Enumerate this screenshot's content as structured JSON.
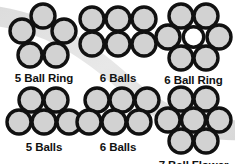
{
  "figure": {
    "background_color": "#ffffff",
    "swoosh_color": "#e4e4e4",
    "ball_fill": "#d2d2d2",
    "ball_stroke": "#111111",
    "hollow_fill": "#ffffff",
    "label_color": "#111111"
  },
  "diagrams": [
    {
      "id": "5-ball-ring",
      "label": "5 Ball Ring",
      "ball_count": 5,
      "center": "hollow",
      "arrangement": "pentagon ring",
      "row": 0,
      "column": 0,
      "balls": [
        {
          "cx": 34,
          "cy": 14,
          "filled": true
        },
        {
          "cx": 13,
          "cy": 29,
          "filled": true
        },
        {
          "cx": 55,
          "cy": 29,
          "filled": true
        },
        {
          "cx": 21,
          "cy": 53,
          "filled": true
        },
        {
          "cx": 47,
          "cy": 53,
          "filled": true
        }
      ],
      "radius": 13
    },
    {
      "id": "6-balls-grid",
      "label": "6 Balls",
      "ball_count": 6,
      "center": "none",
      "arrangement": "3 by 2 grid",
      "row": 0,
      "column": 1,
      "balls": [
        {
          "cx": 14,
          "cy": 14,
          "filled": true
        },
        {
          "cx": 40,
          "cy": 14,
          "filled": true
        },
        {
          "cx": 66,
          "cy": 14,
          "filled": true
        },
        {
          "cx": 14,
          "cy": 39,
          "filled": true
        },
        {
          "cx": 40,
          "cy": 39,
          "filled": true
        },
        {
          "cx": 66,
          "cy": 39,
          "filled": true
        }
      ],
      "radius": 13
    },
    {
      "id": "6-ball-ring",
      "label": "6 Ball Ring",
      "ball_count": 6,
      "center": "hollow",
      "arrangement": "hexagon ring with open core",
      "row": 0,
      "column": 2,
      "balls": [
        {
          "cx": 25,
          "cy": 14,
          "filled": true
        },
        {
          "cx": 50,
          "cy": 14,
          "filled": true
        },
        {
          "cx": 12,
          "cy": 35,
          "filled": true
        },
        {
          "cx": 63,
          "cy": 35,
          "filled": true
        },
        {
          "cx": 25,
          "cy": 56,
          "filled": true
        },
        {
          "cx": 50,
          "cy": 56,
          "filled": true
        }
      ],
      "hollow_center": {
        "cx": 37.5,
        "cy": 35,
        "r": 11
      },
      "radius": 13
    },
    {
      "id": "5-balls-pyramid",
      "label": "5 Balls",
      "ball_count": 5,
      "center": "none",
      "arrangement": "2 over 3 pyramid",
      "row": 1,
      "column": 0,
      "balls": [
        {
          "cx": 25,
          "cy": 14,
          "filled": true
        },
        {
          "cx": 50,
          "cy": 14,
          "filled": true
        },
        {
          "cx": 13,
          "cy": 36,
          "filled": true
        },
        {
          "cx": 38,
          "cy": 36,
          "filled": true
        },
        {
          "cx": 63,
          "cy": 36,
          "filled": true
        }
      ],
      "radius": 13
    },
    {
      "id": "6-balls-staggered",
      "label": "6 Balls",
      "ball_count": 6,
      "center": "none",
      "arrangement": "staggered 3 over 3",
      "row": 1,
      "column": 1,
      "balls": [
        {
          "cx": 21,
          "cy": 14,
          "filled": true
        },
        {
          "cx": 46,
          "cy": 14,
          "filled": true
        },
        {
          "cx": 71,
          "cy": 14,
          "filled": true
        },
        {
          "cx": 13,
          "cy": 36,
          "filled": true
        },
        {
          "cx": 38,
          "cy": 36,
          "filled": true
        },
        {
          "cx": 63,
          "cy": 36,
          "filled": true
        }
      ],
      "radius": 13
    },
    {
      "id": "7-ball-flower",
      "label": "7 Ball Flower",
      "ball_count": 7,
      "center": "filled",
      "arrangement": "hexagon ring with center ball",
      "row": 1,
      "column": 2,
      "balls": [
        {
          "cx": 25,
          "cy": 13,
          "filled": true
        },
        {
          "cx": 50,
          "cy": 13,
          "filled": true
        },
        {
          "cx": 12,
          "cy": 34,
          "filled": true
        },
        {
          "cx": 37.5,
          "cy": 34,
          "filled": true
        },
        {
          "cx": 63,
          "cy": 34,
          "filled": true
        },
        {
          "cx": 25,
          "cy": 55,
          "filled": true
        },
        {
          "cx": 50,
          "cy": 55,
          "filled": true
        }
      ],
      "radius": 13
    }
  ]
}
